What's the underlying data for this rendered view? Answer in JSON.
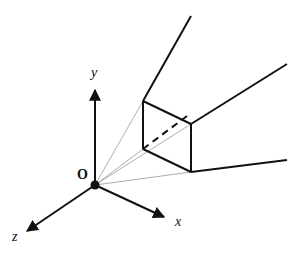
{
  "diagram": {
    "type": "3d-coordinate-frustum",
    "colors": {
      "line": "#111111",
      "thin": "#999999",
      "background": "#ffffff"
    },
    "labels": {
      "origin": "O",
      "x_axis": "x",
      "y_axis": "y",
      "z_axis": "z"
    },
    "origin": [
      95,
      185
    ],
    "axes": {
      "y": {
        "from": [
          95,
          185
        ],
        "to": [
          95,
          88
        ]
      },
      "x": {
        "from": [
          95,
          185
        ],
        "to": [
          166,
          218
        ]
      },
      "z": {
        "from": [
          95,
          185
        ],
        "to": [
          25,
          232
        ]
      }
    },
    "near_face": {
      "top_left": [
        143,
        101
      ],
      "bottom_left": [
        143,
        149
      ],
      "top_right": [
        191,
        124
      ],
      "bottom_right": [
        191,
        172
      ]
    },
    "far_edges": [
      {
        "from": [
          143,
          101
        ],
        "to": [
          191,
          16
        ]
      },
      {
        "from": [
          191,
          124
        ],
        "to": [
          287,
          64
        ]
      },
      {
        "from": [
          191,
          172
        ],
        "to": [
          287,
          160
        ]
      }
    ],
    "hidden_edge": {
      "from": [
        143,
        149
      ],
      "to": [
        191,
        113
      ],
      "style": "dashed"
    },
    "projection_rays": [
      {
        "from": [
          95,
          185
        ],
        "to": [
          143,
          101
        ]
      },
      {
        "from": [
          95,
          185
        ],
        "to": [
          143,
          149
        ]
      },
      {
        "from": [
          95,
          185
        ],
        "to": [
          191,
          124
        ]
      },
      {
        "from": [
          95,
          185
        ],
        "to": [
          191,
          172
        ]
      }
    ]
  }
}
